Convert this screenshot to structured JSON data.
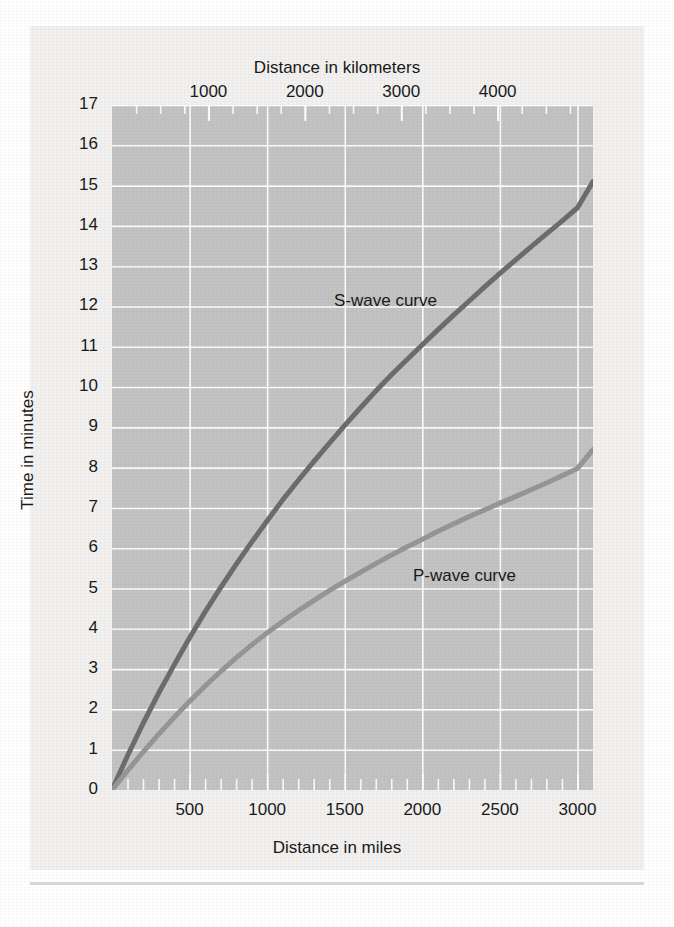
{
  "chart_data": {
    "type": "line",
    "title": "",
    "subtitle": "",
    "xlabel": "Distance in miles",
    "xlabel_top": "Distance in kilometers",
    "ylabel": "Time in minutes",
    "xlim": [
      0,
      3100
    ],
    "ylim": [
      0,
      17
    ],
    "xlim_top_km": [
      0,
      4989
    ],
    "grid": true,
    "grid_color": "#ffffff",
    "plot_background": "#c3c3c3",
    "legend_position": "inline-annotations",
    "x_ticks_miles": [
      500,
      1000,
      1500,
      2000,
      2500,
      3000
    ],
    "x_minor_tick_interval_miles": 100,
    "x_ticks_km": [
      1000,
      2000,
      3000,
      4000
    ],
    "y_ticks": [
      0,
      1,
      2,
      3,
      4,
      5,
      6,
      7,
      8,
      9,
      10,
      11,
      12,
      13,
      14,
      15,
      16,
      17
    ],
    "series": [
      {
        "name": "S-wave curve",
        "color": "#6d6d6d",
        "line_width": 5,
        "label_x_miles": 1430,
        "label_y_minutes": 12.4,
        "x": [
          0,
          100,
          200,
          300,
          400,
          500,
          600,
          700,
          800,
          900,
          1000,
          1100,
          1200,
          1300,
          1400,
          1500,
          1600,
          1700,
          1800,
          1900,
          2000,
          2100,
          2200,
          2300,
          2400,
          2500,
          2600,
          2700,
          2800,
          2900,
          3000,
          3100
        ],
        "y": [
          0,
          0.85,
          1.65,
          2.4,
          3.1,
          3.78,
          4.42,
          5.02,
          5.6,
          6.15,
          6.68,
          7.2,
          7.68,
          8.15,
          8.6,
          9.05,
          9.48,
          9.9,
          10.3,
          10.68,
          11.05,
          11.42,
          11.78,
          12.13,
          12.48,
          12.82,
          13.15,
          13.48,
          13.8,
          14.12,
          14.45,
          15.1
        ]
      },
      {
        "name": "P-wave curve",
        "color": "#969696",
        "line_width": 5,
        "label_x_miles": 1940,
        "label_y_minutes": 5.55,
        "x": [
          0,
          100,
          200,
          300,
          400,
          500,
          600,
          700,
          800,
          900,
          1000,
          1100,
          1200,
          1300,
          1400,
          1500,
          1600,
          1700,
          1800,
          1900,
          2000,
          2100,
          2200,
          2300,
          2400,
          2500,
          2600,
          2700,
          2800,
          2900,
          3000,
          3100
        ],
        "y": [
          0,
          0.48,
          0.94,
          1.38,
          1.8,
          2.2,
          2.58,
          2.94,
          3.28,
          3.6,
          3.9,
          4.18,
          4.45,
          4.7,
          4.95,
          5.18,
          5.4,
          5.62,
          5.83,
          6.03,
          6.22,
          6.42,
          6.6,
          6.78,
          6.95,
          7.12,
          7.28,
          7.45,
          7.62,
          7.8,
          7.98,
          8.45
        ]
      }
    ],
    "annotations": [
      {
        "text": "S-wave curve",
        "x_miles": 1430,
        "y_minutes": 12.4
      },
      {
        "text": "P-wave curve",
        "x_miles": 1940,
        "y_minutes": 5.55
      }
    ]
  },
  "axes": {
    "top": {
      "title": "Distance in kilometers",
      "tick_labels": [
        "1000",
        "2000",
        "3000",
        "4000"
      ]
    },
    "bottom": {
      "title": "Distance in miles",
      "tick_labels": [
        "500",
        "1000",
        "1500",
        "2000",
        "2500",
        "3000"
      ]
    },
    "left": {
      "title": "Time in minutes",
      "tick_labels": [
        "17",
        "16",
        "15",
        "14",
        "13",
        "12",
        "11",
        "10",
        "9",
        "8",
        "7",
        "6",
        "5",
        "4",
        "3",
        "2",
        "1",
        "0"
      ]
    }
  },
  "curves": {
    "s_wave_label": "S-wave curve",
    "p_wave_label": "P-wave curve"
  },
  "colors": {
    "plot_background": "#c3c3c3",
    "gridline": "#ffffff",
    "s_wave": "#6d6d6d",
    "p_wave": "#969696",
    "text": "#1a1a1a",
    "paper": "#f2f1ef"
  }
}
